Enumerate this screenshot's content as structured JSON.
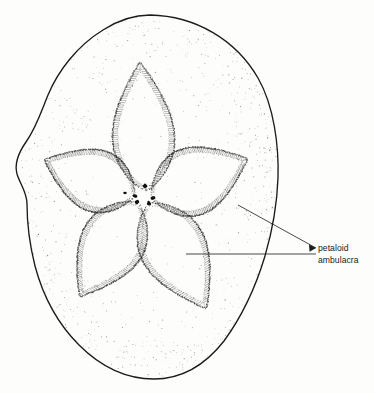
{
  "figure": {
    "background_color": "#fdfdfc",
    "ink_color": "#1b1b1b",
    "stipple_color": "#5a5a5a",
    "hatch_color": "#2a2a2a",
    "pore_color": "#111111"
  },
  "annotations": [
    {
      "id": "petaloid-ambulacra",
      "line1": "petaloid",
      "line2": "ambulacra",
      "text_x": 318,
      "text_y": 251,
      "line_height": 11.5,
      "leaders": [
        {
          "from_x": 316,
          "from_y": 248,
          "to_x": 238,
          "to_y": 205
        },
        {
          "from_x": 316,
          "from_y": 254,
          "to_x": 186,
          "to_y": 254
        }
      ],
      "arrow_x": 316,
      "arrow_y": 248
    }
  ],
  "body_outline": {
    "center_x": 147,
    "center_y": 197,
    "top_y": 15,
    "bottom_y": 379,
    "left_x": 16,
    "right_x": 278,
    "path": "M 150,15 C 196,16 236,40 258,78 C 274,106 279,146 278,178 C 277,206 272,232 265,256 C 256,286 243,315 224,341 C 206,364 182,379 154,379 C 126,379 100,366 79,345 C 58,324 43,296 35,266 C 29,242 27,220 27,204 C 27,192 20,184 17,174 C 14,163 19,152 26,142 C 36,128 41,112 48,95 C 58,71 77,46 103,30 C 117,21 133,15 150,15 Z"
  },
  "petals": [
    {
      "name": "petal-anterior",
      "angle_deg": -90,
      "tip_x": 140,
      "tip_y": 63,
      "base_x": 146,
      "base_y": 190,
      "half_width": 31,
      "pore_x": 145,
      "pore_y": 186
    },
    {
      "name": "petal-right-anterior",
      "angle_deg": -16,
      "tip_x": 247,
      "tip_y": 159,
      "base_x": 152,
      "base_y": 198,
      "half_width": 34,
      "pore_x": 153,
      "pore_y": 198
    },
    {
      "name": "petal-right-posterior",
      "angle_deg": 62,
      "tip_x": 206,
      "tip_y": 308,
      "base_x": 149,
      "base_y": 204,
      "half_width": 33,
      "pore_x": 149,
      "pore_y": 203
    },
    {
      "name": "petal-left-posterior",
      "angle_deg": 118,
      "tip_x": 80,
      "tip_y": 296,
      "base_x": 137,
      "base_y": 203,
      "half_width": 32,
      "pore_x": 137,
      "pore_y": 202
    },
    {
      "name": "petal-left-anterior",
      "angle_deg": 196,
      "tip_x": 45,
      "tip_y": 160,
      "base_x": 134,
      "base_y": 196,
      "half_width": 31,
      "pore_x": 135,
      "pore_y": 196
    }
  ],
  "apical_pores": [
    {
      "x": 145,
      "y": 186,
      "r": 2.1
    },
    {
      "x": 153,
      "y": 198,
      "r": 2.0
    },
    {
      "x": 149,
      "y": 204,
      "r": 1.9
    },
    {
      "x": 137,
      "y": 202,
      "r": 2.0
    },
    {
      "x": 135,
      "y": 196,
      "r": 1.8
    },
    {
      "x": 125,
      "y": 193,
      "r": 1.6
    }
  ]
}
